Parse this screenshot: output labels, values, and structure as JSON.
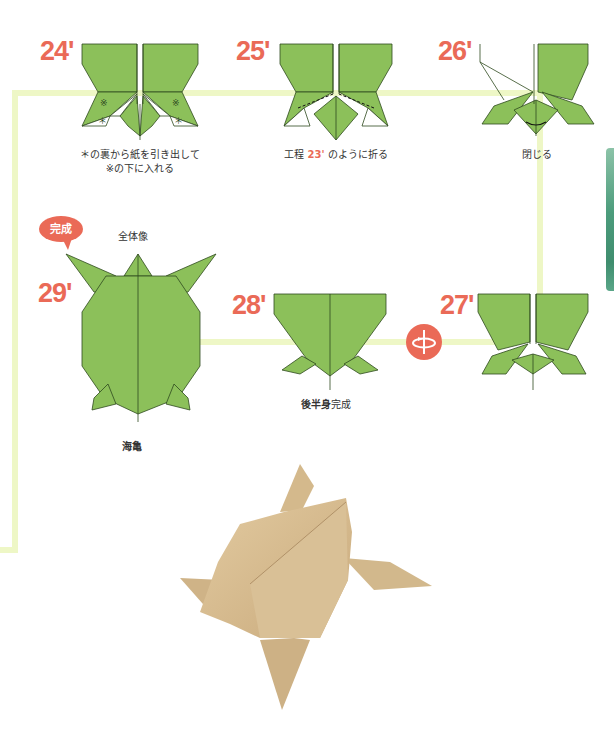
{
  "page": {
    "colors": {
      "step_number": "#ea6a57",
      "paper_green": "#8cc05a",
      "paper_outline": "#2e4a1e",
      "connector": "#eef7c6",
      "badge": "#ea6a57",
      "side_tab": "#4c9c7c",
      "photo_paper": "#d8be94"
    }
  },
  "steps": [
    {
      "id": "24",
      "label": "24'",
      "caption_lines": [
        "＊の裏から紙を引き出して",
        "※の下に入れる"
      ],
      "marks": [
        "※",
        "＊"
      ]
    },
    {
      "id": "25",
      "label": "25'",
      "caption_prefix": "工程 ",
      "caption_ref": "23'",
      "caption_suffix": " のように折る"
    },
    {
      "id": "26",
      "label": "26'",
      "caption": "閉じる"
    },
    {
      "id": "27",
      "label": "27'",
      "icon": "rotate-flip-icon"
    },
    {
      "id": "28",
      "label": "28'",
      "caption_bold": "後半身",
      "caption_normal": "完成"
    },
    {
      "id": "29",
      "label": "29'",
      "badge": "完成",
      "caption_top": "全体像",
      "caption_bottom": "海亀"
    }
  ],
  "photo": {
    "subject": "folded origami sea turtle (kraft paper)"
  }
}
